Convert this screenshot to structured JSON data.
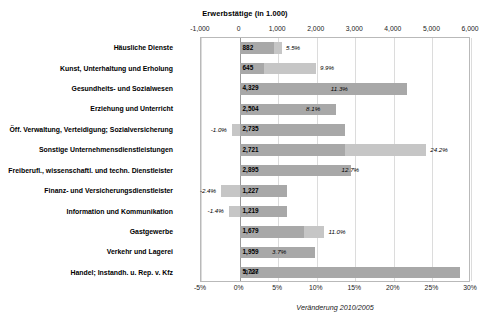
{
  "chart_data": {
    "type": "bar",
    "title": "Erwerbstätige (in 1.000)",
    "xlabel": "Veränderung 2010/2005",
    "ylabel": "",
    "orientation": "horizontal",
    "grid": true,
    "legend": "none",
    "top_axis": {
      "label": "Erwerbstätige (in 1.000)",
      "ticks": [
        "-1,000",
        "0",
        "1,000",
        "2,000",
        "3,000",
        "4,000",
        "5,000",
        "6,000"
      ],
      "tick_values": [
        -1000,
        0,
        1000,
        2000,
        3000,
        4000,
        5000,
        6000
      ],
      "range": [
        -1000,
        6000
      ]
    },
    "bottom_axis": {
      "label": "Veränderung 2010/2005",
      "ticks": [
        "-5%",
        "0%",
        "5%",
        "10%",
        "15%",
        "20%",
        "25%",
        "30%"
      ],
      "tick_values": [
        -5,
        0,
        5,
        10,
        15,
        20,
        25,
        30
      ],
      "range": [
        -5,
        30
      ]
    },
    "categories": [
      "Häusliche Dienste",
      "Kunst, Unterhaltung und Erholung",
      "Gesundheits- und Sozialwesen",
      "Erziehung und Unterricht",
      "Öff. Verwaltung, Verteidigung; Sozialversicherung",
      "Sonstige Unternehmensdienstleistungen",
      "Freiberufl., wissenschaftl. und techn. Dienstleister",
      "Finanz- und Versicherungsdienstleister",
      "Information und Kommunikation",
      "Gastgewerbe",
      "Verkehr und Lagerei",
      "Handel; Instandh. u. Rep. v. Kfz"
    ],
    "series": [
      {
        "name": "Erwerbstätige (in 1.000)",
        "unit": "1000",
        "values": [
          882,
          645,
          4329,
          2504,
          2735,
          2721,
          2895,
          1227,
          1219,
          1679,
          1959,
          5727
        ],
        "labels": [
          "882",
          "645",
          "4,329",
          "2,504",
          "2,735",
          "2,721",
          "2,895",
          "1,227",
          "1,219",
          "1,679",
          "1,959",
          "5,727"
        ]
      },
      {
        "name": "Veränderung 2010/2005",
        "unit": "percent",
        "values": [
          5.5,
          9.9,
          11.3,
          8.1,
          -1.0,
          24.2,
          12.7,
          -2.4,
          -1.4,
          11.0,
          3.7,
          0.1
        ],
        "labels": [
          "5.5%",
          "9.9%",
          "11.3%",
          "8.1%",
          "-1.0%",
          "24.2%",
          "12.7%",
          "-2.4%",
          "-1.4%",
          "11.0%",
          "3.7%",
          "0.1%"
        ]
      }
    ],
    "colors": {
      "bar_absolute": "#a8a8a8",
      "bar_percent": "#c6c6c6",
      "grid": "#dcdcdc",
      "frame": "#b9b9b9"
    }
  }
}
